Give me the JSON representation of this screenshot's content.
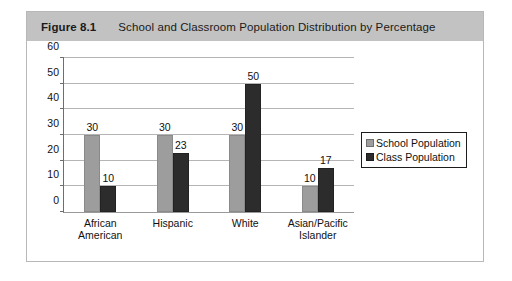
{
  "figure": {
    "number": "Figure 8.1",
    "title": "School and Classroom Population Distribution by Percentage"
  },
  "colors": {
    "header_background": "#c2c2c2",
    "school_series": "#9d9d9d",
    "class_series": "#2c2c2c",
    "gridline": "#b5b5b5",
    "axis": "#6e6e6e"
  },
  "chart_data": {
    "type": "bar",
    "title": "School and Classroom Population Distribution by Percentage",
    "xlabel": "",
    "ylabel": "",
    "ylim": [
      0,
      60
    ],
    "yticks": [
      0,
      10,
      20,
      30,
      40,
      50,
      60
    ],
    "ytick_labels": [
      "0",
      "10",
      "20",
      "30",
      "40",
      "50",
      "60"
    ],
    "grid": true,
    "legend_position": "right",
    "categories": [
      "African American",
      "Hispanic",
      "White",
      "Asian/Pacific\nIslander"
    ],
    "series": [
      {
        "name": "School Population",
        "values": [
          30,
          30,
          30,
          10
        ],
        "labels": [
          "30",
          "30",
          "30",
          "10"
        ]
      },
      {
        "name": "Class Population",
        "values": [
          10,
          23,
          50,
          17
        ],
        "labels": [
          "10",
          "23",
          "50",
          "17"
        ]
      }
    ]
  }
}
